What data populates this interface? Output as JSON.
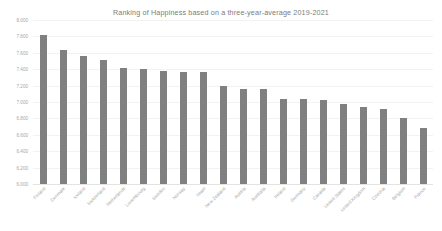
{
  "chart_data": {
    "type": "bar",
    "title": "Ranking of Happiness based on a three-year-average 2019-2021",
    "xlabel": "",
    "ylabel": "",
    "ylim": [
      6.0,
      8.0
    ],
    "ytick_step": 0.2,
    "ytick_labels": [
      "8.000",
      "7.800",
      "7.600",
      "7.400",
      "7.200",
      "7.000",
      "6.800",
      "6.600",
      "6.400",
      "6.200",
      "6.000"
    ],
    "ytick_values": [
      8.0,
      7.8,
      7.6,
      7.4,
      7.2,
      7.0,
      6.8,
      6.6,
      6.4,
      6.2,
      6.0
    ],
    "grid": true,
    "legend": false,
    "legend_position": "none",
    "bar_color": "#808080",
    "categories": [
      "Finland",
      "Denmark",
      "Iceland",
      "Switzerland",
      "Netherlands",
      "Luxembourg",
      "Sweden",
      "Norway",
      "Israel",
      "New Zealand",
      "Austria",
      "Australia",
      "Ireland",
      "Germany",
      "Canada",
      "United States",
      "United Kingdom",
      "Czechia",
      "Belgium",
      "France"
    ],
    "values": [
      7.821,
      7.636,
      7.557,
      7.512,
      7.415,
      7.404,
      7.384,
      7.365,
      7.364,
      7.2,
      7.163,
      7.162,
      7.041,
      7.034,
      7.025,
      6.977,
      6.943,
      6.92,
      6.805,
      6.687
    ]
  }
}
